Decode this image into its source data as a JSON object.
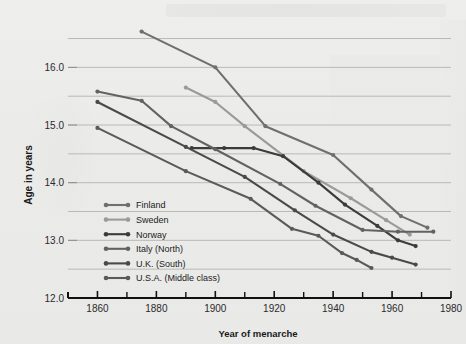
{
  "chart_data": {
    "type": "line",
    "title": "",
    "xlabel": "Year of menarche",
    "ylabel": "Age in years",
    "xlim": [
      1850,
      1980
    ],
    "ylim": [
      12.0,
      16.7
    ],
    "xticks": [
      1860,
      1880,
      1900,
      1920,
      1940,
      1960,
      1980
    ],
    "xticklabels": [
      "1860",
      "1880",
      "1900",
      "1920",
      "1940",
      "1960",
      "1980"
    ],
    "xminorticks": [
      1850,
      1870,
      1890,
      1910,
      1930,
      1950,
      1970
    ],
    "yticks": [
      12.0,
      13.0,
      14.0,
      15.0,
      16.0
    ],
    "yticklabels": [
      "12.0",
      "13.0",
      "14.0",
      "15.0",
      "16.0"
    ],
    "gridlines_y": [
      12.5,
      13.0,
      13.5,
      14.0,
      14.5,
      15.0,
      15.5,
      16.0,
      16.5
    ],
    "grid": true,
    "legend_position": "lower-left-inside",
    "series": [
      {
        "name": "Finland",
        "color": "#6f6f6f",
        "points": [
          [
            1875,
            16.62
          ],
          [
            1900,
            16.0
          ],
          [
            1917,
            14.98
          ],
          [
            1940,
            14.48
          ],
          [
            1953,
            13.88
          ],
          [
            1963,
            13.42
          ],
          [
            1972,
            13.22
          ]
        ]
      },
      {
        "name": "Sweden",
        "color": "#9a9a9a",
        "points": [
          [
            1890,
            15.65
          ],
          [
            1900,
            15.4
          ],
          [
            1910,
            14.98
          ],
          [
            1930,
            14.2
          ],
          [
            1946,
            13.73
          ],
          [
            1958,
            13.35
          ],
          [
            1966,
            13.1
          ]
        ]
      },
      {
        "name": "Norway",
        "color": "#3b3b3b",
        "points": [
          [
            1892,
            14.6
          ],
          [
            1903,
            14.6
          ],
          [
            1913,
            14.6
          ],
          [
            1923,
            14.46
          ],
          [
            1935,
            14.0
          ],
          [
            1944,
            13.62
          ],
          [
            1955,
            13.25
          ],
          [
            1962,
            13.0
          ],
          [
            1968,
            12.9
          ]
        ]
      },
      {
        "name": "Italy (North)",
        "color": "#626262",
        "points": [
          [
            1860,
            15.58
          ],
          [
            1875,
            15.42
          ],
          [
            1885,
            14.98
          ],
          [
            1900,
            14.58
          ],
          [
            1922,
            13.98
          ],
          [
            1934,
            13.6
          ],
          [
            1950,
            13.18
          ],
          [
            1962,
            13.15
          ],
          [
            1974,
            13.15
          ]
        ]
      },
      {
        "name": "U.K. (South)",
        "color": "#4a4a4a",
        "points": [
          [
            1860,
            15.4
          ],
          [
            1890,
            14.62
          ],
          [
            1910,
            14.1
          ],
          [
            1927,
            13.52
          ],
          [
            1940,
            13.1
          ],
          [
            1953,
            12.8
          ],
          [
            1960,
            12.7
          ],
          [
            1968,
            12.58
          ]
        ]
      },
      {
        "name": "U.S.A. (Middle class)",
        "color": "#5a5a5a",
        "points": [
          [
            1860,
            14.95
          ],
          [
            1890,
            14.2
          ],
          [
            1912,
            13.72
          ],
          [
            1926,
            13.2
          ],
          [
            1935,
            13.08
          ],
          [
            1943,
            12.78
          ],
          [
            1948,
            12.66
          ],
          [
            1953,
            12.52
          ]
        ]
      }
    ]
  }
}
